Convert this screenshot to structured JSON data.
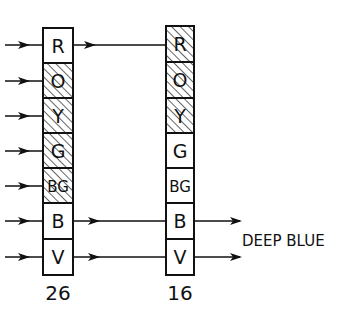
{
  "diagram": {
    "left_column": {
      "cells": [
        {
          "label": "R",
          "hatched": false
        },
        {
          "label": "O",
          "hatched": true
        },
        {
          "label": "Y",
          "hatched": true
        },
        {
          "label": "G",
          "hatched": true
        },
        {
          "label": "BG",
          "hatched": true
        },
        {
          "label": "B",
          "hatched": false
        },
        {
          "label": "V",
          "hatched": false
        }
      ],
      "count": "26"
    },
    "right_column": {
      "cells": [
        {
          "label": "R",
          "hatched": true
        },
        {
          "label": "O",
          "hatched": true
        },
        {
          "label": "Y",
          "hatched": true
        },
        {
          "label": "G",
          "hatched": false
        },
        {
          "label": "BG",
          "hatched": false
        },
        {
          "label": "B",
          "hatched": false
        },
        {
          "label": "V",
          "hatched": false
        }
      ],
      "count": "16"
    },
    "output_label": "DEEP BLUE",
    "colors": {
      "ink": "#111111",
      "background": "#ffffff"
    }
  }
}
